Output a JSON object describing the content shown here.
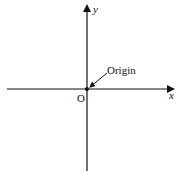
{
  "diagram": {
    "type": "cartesian-axes",
    "colors": {
      "axis": "#111111",
      "background": "#ffffff"
    },
    "labels": {
      "x_axis": "x",
      "y_axis": "y",
      "origin_point": "O",
      "origin_callout": "Origin"
    }
  }
}
